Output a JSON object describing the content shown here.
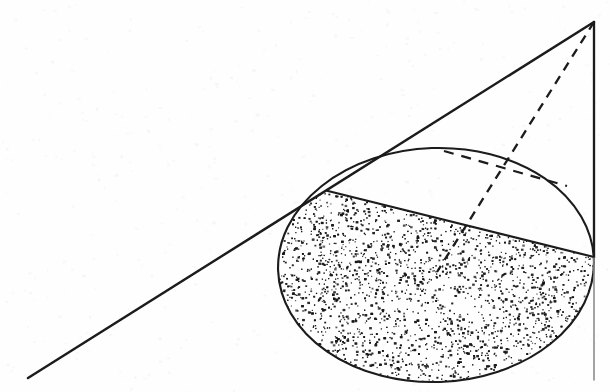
{
  "page": {
    "width": 610,
    "height": 392,
    "background_color": "#fefefe",
    "ink_color": "#1a1a1a",
    "noise_color": "#f2f2f2"
  },
  "caption": {
    "fragment_left": "volume",
    "fragment_right": "kept",
    "note": "top line of text clipped by the page crop; only descender pixels visible"
  },
  "figure": {
    "apex": {
      "label": "apex",
      "x": 594,
      "y": 22
    },
    "tangent_point": {
      "label": "tangent-point",
      "x": 328,
      "y": 191
    },
    "chord_left": {
      "x": 328,
      "y": 191
    },
    "chord_right": {
      "x": 594,
      "y": 257
    },
    "ellipse": {
      "center_x": 436,
      "center_y": 265,
      "radius_x": 158,
      "radius_y": 117,
      "rotation_deg": -2
    },
    "lines": [
      {
        "name": "tangent-line",
        "style": "solid",
        "x1": 28,
        "y1": 378,
        "x2": 594,
        "y2": 22
      },
      {
        "name": "axis-line",
        "style": "solid",
        "x1": 594,
        "y1": 22,
        "x2": 594,
        "y2": 380
      },
      {
        "name": "apex-radius-dashed",
        "style": "dashed",
        "x1": 594,
        "y1": 22,
        "x2": 437,
        "y2": 272
      },
      {
        "name": "chord-line",
        "style": "solid",
        "x1": 328,
        "y1": 191,
        "x2": 594,
        "y2": 257
      },
      {
        "name": "top-tangent-dashed",
        "style": "dashed",
        "x1": 444,
        "y1": 151,
        "x2": 567,
        "y2": 186
      }
    ],
    "shading": {
      "name": "stipple-fill",
      "region": "lower segment of ellipse below the chord",
      "pattern": "random dots",
      "dot_count": 3400,
      "dot_color": "#141414"
    }
  }
}
